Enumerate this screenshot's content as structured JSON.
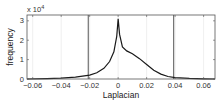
{
  "chart_data": {
    "type": "line",
    "title": "",
    "xlabel": "Laplacian",
    "ylabel": "frequency",
    "y_multiplier": "x 10^4",
    "xlim": [
      -0.064,
      0.068
    ],
    "ylim": [
      0,
      3.3
    ],
    "xticks": [
      -0.06,
      -0.04,
      -0.02,
      0,
      0.02,
      0.04,
      0.06
    ],
    "xtick_labels": [
      "−0.06",
      "−0.04",
      "−0.02",
      "0",
      "0.02",
      "0.04",
      "0.06"
    ],
    "yticks": [
      0,
      1,
      2,
      3
    ],
    "ytick_labels": [
      "0",
      "1",
      "2",
      "3"
    ],
    "grid": true,
    "legend": null,
    "series": [
      {
        "name": "histogram",
        "x": [
          -0.064,
          -0.05,
          -0.04,
          -0.03,
          -0.02,
          -0.015,
          -0.01,
          -0.006,
          -0.003,
          -0.001,
          0,
          0.001,
          0.003,
          0.006,
          0.01,
          0.015,
          0.02,
          0.025,
          0.03,
          0.035,
          0.04,
          0.05,
          0.06,
          0.068
        ],
        "values": [
          0.0,
          0.02,
          0.05,
          0.1,
          0.2,
          0.32,
          0.55,
          0.9,
          1.4,
          2.2,
          3.1,
          2.3,
          1.65,
          1.45,
          1.3,
          1.05,
          0.75,
          0.45,
          0.25,
          0.13,
          0.07,
          0.03,
          0.01,
          0.0
        ]
      }
    ],
    "vertical_lines": [
      {
        "x": -0.021,
        "style": "solid",
        "color": "#555555"
      },
      {
        "x": 0.039,
        "style": "solid",
        "color": "#555555"
      }
    ]
  },
  "labels": {
    "x_axis": "Laplacian",
    "y_axis": "frequency",
    "multiplier_base": "x 10",
    "multiplier_exp": "4"
  }
}
